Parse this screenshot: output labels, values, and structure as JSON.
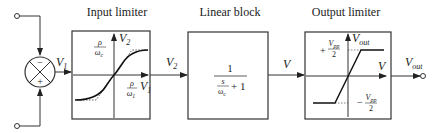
{
  "diagram": {
    "type": "block-diagram",
    "colors": {
      "stroke": "#333333",
      "background": "#ffffff",
      "text": "#222222"
    },
    "summing_junction": {
      "top_sign": "−",
      "bottom_sign": "+",
      "output_label": "V",
      "output_sub": "1"
    },
    "blocks": [
      {
        "title": "Input limiter",
        "graph": {
          "y_axis_label": "V",
          "y_axis_sub": "2",
          "x_axis_label": "V",
          "x_axis_sub": "1",
          "y_tick_num": "ρ",
          "y_tick_den": "ω",
          "y_tick_den_sub": "c",
          "x_tick_num": "ρ",
          "x_tick_den": "ω",
          "x_tick_den_sub": "1",
          "curve": "smooth sigmoid saturation with dotted piecewise-linear asymptotes"
        }
      },
      {
        "title": "Linear block",
        "transfer_function": {
          "numerator": "1",
          "den_s": "s",
          "den_omega": "ω",
          "den_omega_sub": "c",
          "den_plus": "+ 1"
        }
      },
      {
        "title": "Output limiter",
        "graph": {
          "y_axis_label": "V",
          "y_axis_sub": "out",
          "x_axis_label": "V",
          "pos_sign": "+",
          "neg_sign": "−",
          "level_num": "V",
          "level_num_sub": "pp",
          "level_den": "2",
          "curve": "hard saturation (piecewise linear)"
        }
      }
    ],
    "signals": {
      "v1": {
        "label": "V",
        "sub": "1"
      },
      "v2": {
        "label": "V",
        "sub": "2"
      },
      "v": {
        "label": "V"
      },
      "vout": {
        "label": "V",
        "sub": "out"
      }
    }
  }
}
